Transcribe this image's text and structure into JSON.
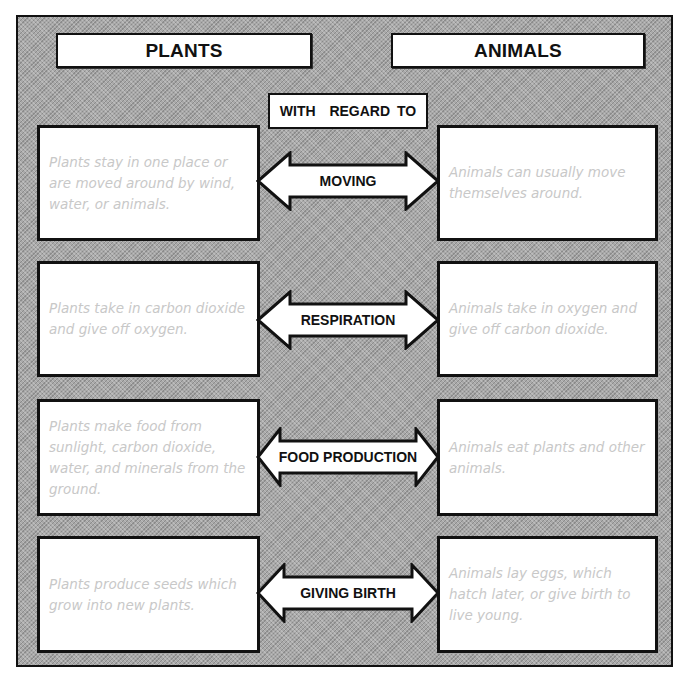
{
  "headers": {
    "left": "PLANTS",
    "right": "ANIMALS",
    "center": "WITH  REGARD TO"
  },
  "rows": [
    {
      "topic": "MOVING",
      "plants": "Plants stay in one place or are moved around by wind, water, or animals.",
      "animals": "Animals can usually move themselves around."
    },
    {
      "topic": "RESPIRATION",
      "plants": "Plants take in carbon dioxide and give off oxygen.",
      "animals": "Animals take in oxygen and give off carbon dioxide."
    },
    {
      "topic": "FOOD PRODUCTION",
      "plants": "Plants make food from sunlight, carbon dioxide, water, and minerals from the ground.",
      "animals": "Animals eat plants and other animals."
    },
    {
      "topic": "GIVING BIRTH",
      "plants": "Plants produce seeds which grow into new plants.",
      "animals": "Animals lay eggs, which hatch later, or give birth to live young."
    }
  ],
  "colors": {
    "background_stipple": "#a9a9a9",
    "border": "#111111",
    "box_fill": "#ffffff",
    "answer_text": "#c8c8c8"
  }
}
